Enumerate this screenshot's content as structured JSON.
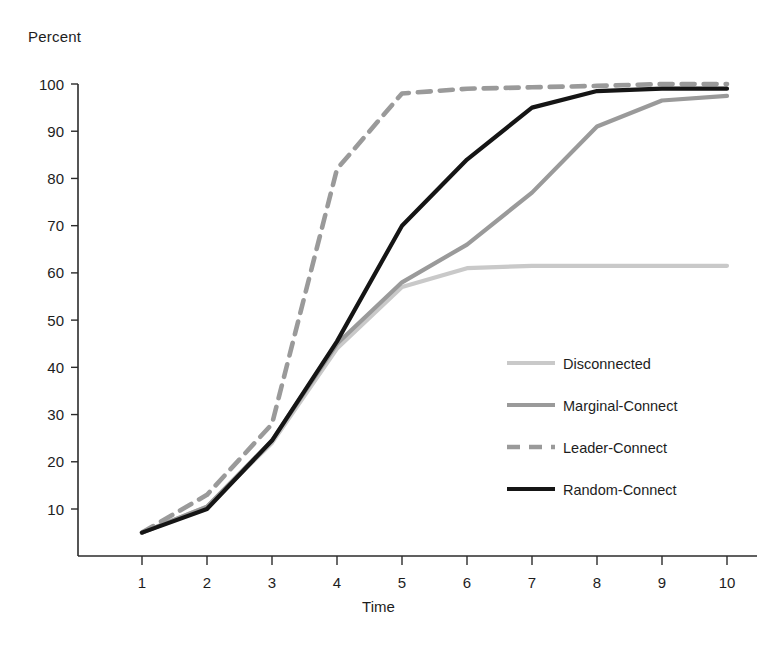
{
  "chart_data": {
    "type": "line",
    "title": "",
    "xlabel": "Time",
    "ylabel": "Percent",
    "x": [
      1,
      2,
      3,
      4,
      5,
      6,
      7,
      8,
      9,
      10
    ],
    "xlim": [
      0.6,
      10.4
    ],
    "ylim": [
      0,
      103
    ],
    "xticks": [
      "1",
      "2",
      "3",
      "4",
      "5",
      "6",
      "7",
      "8",
      "9",
      "10"
    ],
    "yticks": [
      "10",
      "20",
      "30",
      "40",
      "50",
      "60",
      "70",
      "80",
      "90",
      "100"
    ],
    "ytick_values": [
      10,
      20,
      30,
      40,
      50,
      60,
      70,
      80,
      90,
      100
    ],
    "grid": false,
    "legend_position": "center-right",
    "series": [
      {
        "name": "Disconnected",
        "values": [
          5,
          10.5,
          24,
          44,
          57,
          61,
          61.5,
          61.5,
          61.5,
          61.5
        ],
        "color": "#c9c9c9",
        "width": 4.2,
        "dash": "none"
      },
      {
        "name": "Marginal-Connect",
        "values": [
          5,
          10.5,
          24.5,
          45,
          58,
          66,
          77,
          91,
          96.5,
          97.5
        ],
        "color": "#9a9a9a",
        "width": 4.2,
        "dash": "none"
      },
      {
        "name": "Leader-Connect",
        "values": [
          5,
          13,
          28,
          82,
          98,
          99,
          99.3,
          99.6,
          100,
          100
        ],
        "color": "#9a9a9a",
        "width": 4.6,
        "dash": "13,9"
      },
      {
        "name": "Random-Connect",
        "values": [
          5,
          10,
          24.5,
          45.5,
          70,
          84,
          95,
          98.5,
          99,
          99
        ],
        "color": "#151515",
        "width": 4.2,
        "dash": "none"
      }
    ]
  },
  "legend": {
    "items": [
      {
        "label": "Disconnected"
      },
      {
        "label": "Marginal-Connect"
      },
      {
        "label": "Leader-Connect"
      },
      {
        "label": "Random-Connect"
      }
    ]
  },
  "axes": {
    "y_axis_title": "Percent",
    "x_axis_title": "Time"
  }
}
